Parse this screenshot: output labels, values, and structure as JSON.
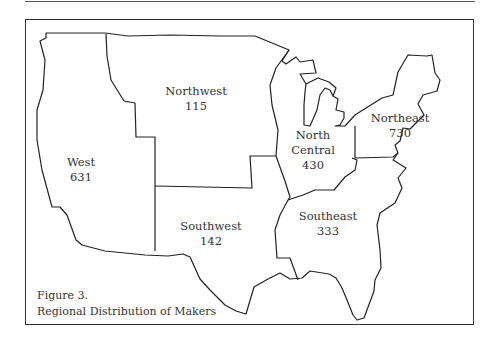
{
  "figure": {
    "number_label": "Figure 3.",
    "title": "Regional Distribution of Makers"
  },
  "regions": [
    {
      "name": "West",
      "value": "631"
    },
    {
      "name": "Northwest",
      "value": "115"
    },
    {
      "name": "North Central",
      "name_line1": "North",
      "name_line2": "Central",
      "value": "430"
    },
    {
      "name": "Northeast",
      "value": "730"
    },
    {
      "name": "Southwest",
      "value": "142"
    },
    {
      "name": "Southeast",
      "value": "333"
    }
  ],
  "colors": {
    "line": "#222222",
    "text": "#333333",
    "background": "#ffffff"
  }
}
